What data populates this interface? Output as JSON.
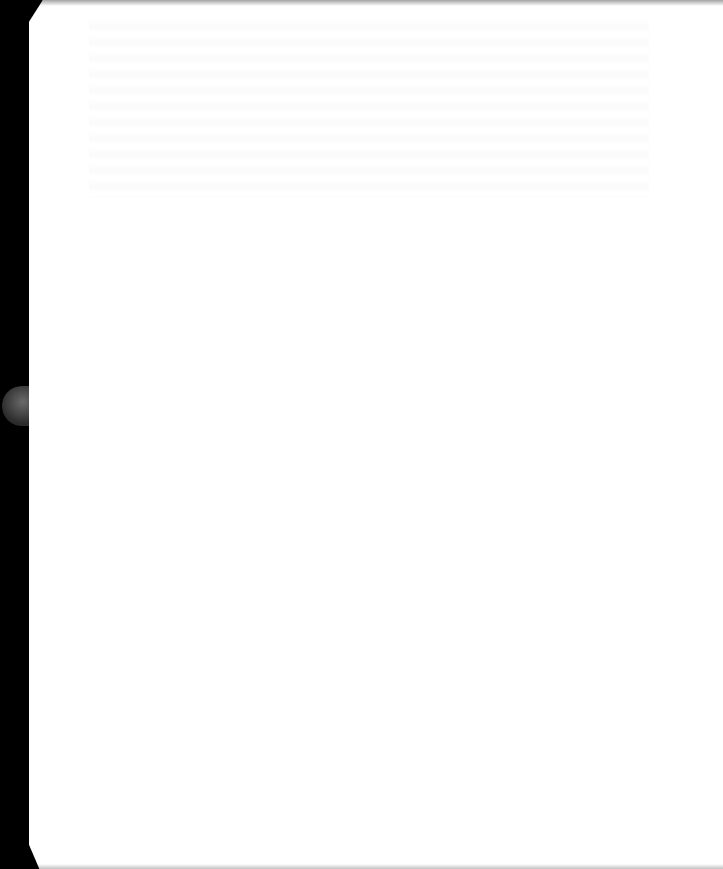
{
  "document": {
    "description": "Blank page",
    "page_color": "#ffffff",
    "background_color": "#000000",
    "text_content": ""
  }
}
